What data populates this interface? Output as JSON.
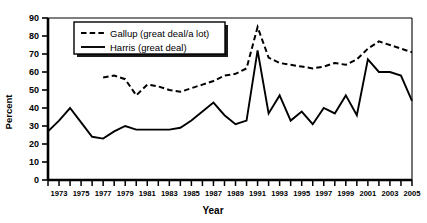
{
  "chart_data": {
    "type": "line",
    "title": "",
    "xlabel": "Year",
    "ylabel": "Percent",
    "ylim": [
      0,
      90
    ],
    "xlim": [
      1972,
      2005
    ],
    "ytick_step": 10,
    "yticks": [
      0,
      10,
      20,
      30,
      40,
      50,
      60,
      70,
      80,
      90
    ],
    "xticks": [
      1972,
      1973,
      1974,
      1975,
      1976,
      1977,
      1978,
      1979,
      1980,
      1981,
      1982,
      1983,
      1984,
      1985,
      1986,
      1987,
      1988,
      1989,
      1990,
      1991,
      1992,
      1993,
      1994,
      1995,
      1996,
      1997,
      1998,
      1999,
      2000,
      2001,
      2002,
      2003,
      2004,
      2005
    ],
    "xtick_labels": [
      "",
      "1973",
      "",
      "1975",
      "",
      "1977",
      "",
      "1979",
      "",
      "1981",
      "",
      "1983",
      "",
      "1985",
      "",
      "1987",
      "",
      "1989",
      "",
      "1991",
      "",
      "1993",
      "",
      "1995",
      "",
      "1997",
      "",
      "1999",
      "",
      "2001",
      "",
      "2003",
      "",
      "2005"
    ],
    "grid": false,
    "legend_position": "top-left-inside",
    "series": [
      {
        "name": "Gallup (great deal/a lot)",
        "style": "dashed",
        "x": [
          1977,
          1978,
          1979,
          1980,
          1981,
          1982,
          1983,
          1984,
          1985,
          1986,
          1987,
          1988,
          1989,
          1990,
          1991,
          1992,
          1993,
          1994,
          1995,
          1996,
          1997,
          1998,
          1999,
          2000,
          2001,
          2002,
          2003,
          2004,
          2005
        ],
        "values": [
          57,
          58,
          56,
          47,
          53,
          52,
          50,
          49,
          51,
          53,
          55,
          58,
          59,
          62,
          85,
          68,
          65,
          64,
          63,
          62,
          63,
          65,
          64,
          67,
          73,
          77,
          75,
          73,
          71
        ]
      },
      {
        "name": "Harris (great deal)",
        "style": "solid",
        "x": [
          1972,
          1973,
          1974,
          1975,
          1976,
          1977,
          1978,
          1979,
          1980,
          1981,
          1982,
          1983,
          1984,
          1985,
          1986,
          1987,
          1988,
          1989,
          1990,
          1991,
          1992,
          1993,
          1994,
          1995,
          1996,
          1997,
          1998,
          1999,
          2000,
          2001,
          2002,
          2003,
          2004,
          2005
        ],
        "values": [
          27,
          33,
          40,
          32,
          24,
          23,
          27,
          30,
          28,
          28,
          28,
          28,
          29,
          33,
          38,
          43,
          36,
          31,
          33,
          72,
          37,
          47,
          33,
          38,
          31,
          40,
          37,
          47,
          36,
          67,
          60,
          60,
          58,
          44
        ]
      }
    ],
    "legend": [
      {
        "label": "Gallup (great deal/a lot)",
        "style": "dashed"
      },
      {
        "label": "Harris (great deal)",
        "style": "solid"
      }
    ]
  }
}
